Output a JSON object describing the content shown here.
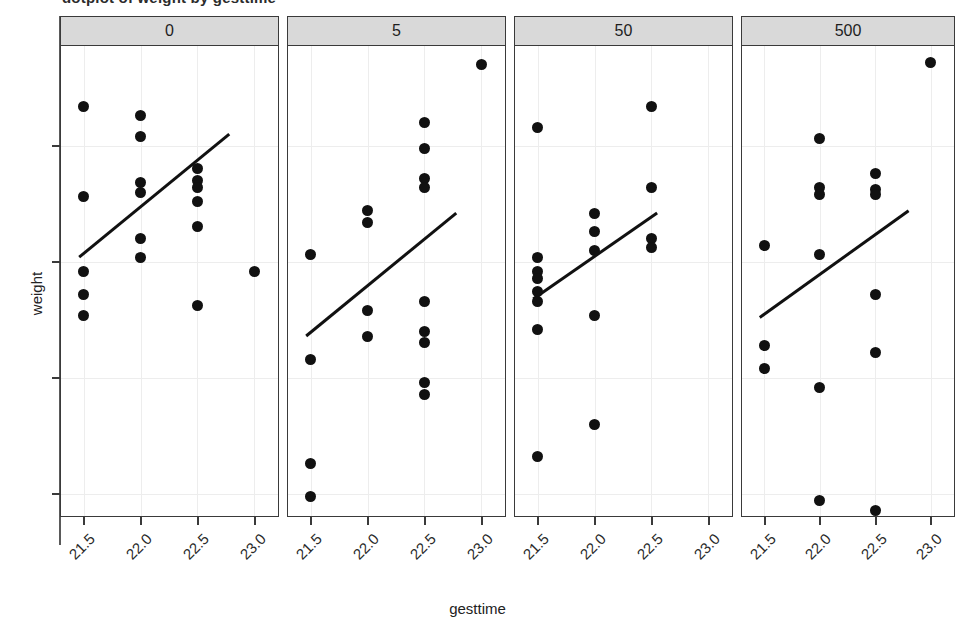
{
  "title": "dotplot of weight by gesttime",
  "axes": {
    "y_title": "weight",
    "x_title": "gesttime",
    "y_ticks": [
      "20",
      "25",
      "30",
      "35"
    ],
    "x_ticks": [
      "21.5",
      "22.0",
      "22.5",
      "23.0"
    ]
  },
  "chart_data": {
    "type": "scatter",
    "title": "dotplot of weight by gesttime",
    "xlabel": "gesttime",
    "ylabel": "weight",
    "xlim": [
      21.3,
      23.2
    ],
    "ylim": [
      19.0,
      39.3
    ],
    "xticks": [
      21.5,
      22.0,
      22.5,
      23.0
    ],
    "yticks": [
      20,
      25,
      30,
      35
    ],
    "grid": true,
    "legend": "none",
    "facet_variable": "dose",
    "facet_layout": "1 row x 4 columns",
    "panels": [
      {
        "label": "0",
        "points": [
          {
            "x": 21.5,
            "y": 36.7
          },
          {
            "x": 21.5,
            "y": 32.8
          },
          {
            "x": 21.5,
            "y": 29.6
          },
          {
            "x": 21.5,
            "y": 28.6
          },
          {
            "x": 21.5,
            "y": 27.7
          },
          {
            "x": 22.0,
            "y": 36.3
          },
          {
            "x": 22.0,
            "y": 35.4
          },
          {
            "x": 22.0,
            "y": 33.4
          },
          {
            "x": 22.0,
            "y": 33.0
          },
          {
            "x": 22.0,
            "y": 31.0
          },
          {
            "x": 22.0,
            "y": 30.2
          },
          {
            "x": 22.5,
            "y": 34.0
          },
          {
            "x": 22.5,
            "y": 33.5
          },
          {
            "x": 22.5,
            "y": 33.2
          },
          {
            "x": 22.5,
            "y": 32.6
          },
          {
            "x": 22.5,
            "y": 31.5
          },
          {
            "x": 22.5,
            "y": 28.1
          },
          {
            "x": 23.0,
            "y": 29.6
          }
        ],
        "fit_line": {
          "x1": 21.46,
          "y1": 30.2,
          "x2": 22.78,
          "y2": 35.5
        }
      },
      {
        "label": "5",
        "points": [
          {
            "x": 21.5,
            "y": 30.3
          },
          {
            "x": 21.5,
            "y": 25.8
          },
          {
            "x": 21.5,
            "y": 21.3
          },
          {
            "x": 21.5,
            "y": 19.9
          },
          {
            "x": 22.0,
            "y": 32.2
          },
          {
            "x": 22.0,
            "y": 31.7
          },
          {
            "x": 22.0,
            "y": 27.9
          },
          {
            "x": 22.0,
            "y": 26.8
          },
          {
            "x": 22.5,
            "y": 36.0
          },
          {
            "x": 22.5,
            "y": 34.9
          },
          {
            "x": 22.5,
            "y": 33.6
          },
          {
            "x": 22.5,
            "y": 33.2
          },
          {
            "x": 22.5,
            "y": 28.3
          },
          {
            "x": 22.5,
            "y": 27.0
          },
          {
            "x": 22.5,
            "y": 26.5
          },
          {
            "x": 22.5,
            "y": 24.8
          },
          {
            "x": 22.5,
            "y": 24.3
          },
          {
            "x": 23.0,
            "y": 38.5
          }
        ],
        "fit_line": {
          "x1": 21.46,
          "y1": 26.8,
          "x2": 22.78,
          "y2": 32.1
        }
      },
      {
        "label": "50",
        "points": [
          {
            "x": 21.5,
            "y": 35.8
          },
          {
            "x": 21.5,
            "y": 30.2
          },
          {
            "x": 21.5,
            "y": 29.6
          },
          {
            "x": 21.5,
            "y": 29.3
          },
          {
            "x": 21.5,
            "y": 28.7
          },
          {
            "x": 21.5,
            "y": 28.3
          },
          {
            "x": 21.5,
            "y": 27.1
          },
          {
            "x": 21.5,
            "y": 21.6
          },
          {
            "x": 22.0,
            "y": 32.1
          },
          {
            "x": 22.0,
            "y": 31.3
          },
          {
            "x": 22.0,
            "y": 30.5
          },
          {
            "x": 22.0,
            "y": 27.7
          },
          {
            "x": 22.0,
            "y": 23.0
          },
          {
            "x": 22.5,
            "y": 36.7
          },
          {
            "x": 22.5,
            "y": 33.2
          },
          {
            "x": 22.5,
            "y": 31.0
          },
          {
            "x": 22.5,
            "y": 30.6
          }
        ],
        "fit_line": {
          "x1": 21.46,
          "y1": 28.4,
          "x2": 22.55,
          "y2": 32.1
        }
      },
      {
        "label": "500",
        "points": [
          {
            "x": 21.5,
            "y": 30.7
          },
          {
            "x": 21.5,
            "y": 26.4
          },
          {
            "x": 21.5,
            "y": 25.4
          },
          {
            "x": 22.0,
            "y": 35.3
          },
          {
            "x": 22.0,
            "y": 33.2
          },
          {
            "x": 22.0,
            "y": 32.9
          },
          {
            "x": 22.0,
            "y": 30.3
          },
          {
            "x": 22.0,
            "y": 24.6
          },
          {
            "x": 22.0,
            "y": 19.7
          },
          {
            "x": 22.5,
            "y": 33.8
          },
          {
            "x": 22.5,
            "y": 33.1
          },
          {
            "x": 22.5,
            "y": 32.9
          },
          {
            "x": 22.5,
            "y": 28.6
          },
          {
            "x": 22.5,
            "y": 26.1
          },
          {
            "x": 22.5,
            "y": 19.3
          },
          {
            "x": 23.0,
            "y": 38.6
          }
        ],
        "fit_line": {
          "x1": 21.46,
          "y1": 27.6,
          "x2": 22.8,
          "y2": 32.2
        }
      }
    ]
  },
  "colors": {
    "point": "#111111",
    "line": "#111111",
    "strip_background": "#d9d9d9",
    "panel_border": "#3a3a3a",
    "gridline": "#ededed"
  }
}
